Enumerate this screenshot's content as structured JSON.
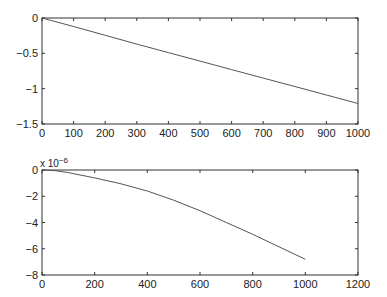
{
  "chart_data": [
    {
      "type": "line",
      "title": "",
      "xlabel": "",
      "ylabel": "",
      "xlim": [
        0,
        1000
      ],
      "ylim": [
        -1.5,
        0
      ],
      "grid": false,
      "xticks": [
        "0",
        "100",
        "200",
        "300",
        "400",
        "500",
        "600",
        "700",
        "800",
        "900",
        "1000"
      ],
      "yticks": [
        "0",
        "-0.5",
        "-1",
        "-1.5"
      ],
      "series": [
        {
          "name": "series1",
          "x": [
            0,
            100,
            200,
            300,
            400,
            500,
            600,
            700,
            800,
            900,
            1000
          ],
          "y": [
            0,
            -0.12,
            -0.245,
            -0.37,
            -0.49,
            -0.61,
            -0.73,
            -0.85,
            -0.97,
            -1.09,
            -1.21
          ]
        }
      ]
    },
    {
      "type": "line",
      "title": "",
      "xlabel": "",
      "ylabel": "",
      "y_exponent_label": "x 10",
      "y_exponent": "-6",
      "xlim": [
        0,
        1200
      ],
      "ylim": [
        -8,
        0
      ],
      "grid": false,
      "xticks": [
        "0",
        "200",
        "400",
        "600",
        "800",
        "1000",
        "1200"
      ],
      "yticks": [
        "0",
        "-2",
        "-4",
        "-6",
        "-8"
      ],
      "series": [
        {
          "name": "series1",
          "x": [
            0,
            50,
            100,
            200,
            300,
            400,
            500,
            600,
            700,
            800,
            900,
            1000
          ],
          "y": [
            0,
            -0.05,
            -0.2,
            -0.6,
            -1.05,
            -1.6,
            -2.3,
            -3.1,
            -4.0,
            -4.9,
            -5.85,
            -6.8
          ]
        }
      ]
    }
  ]
}
